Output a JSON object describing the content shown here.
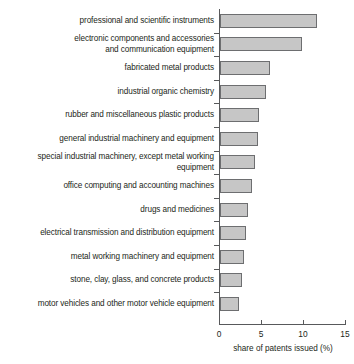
{
  "chart_data": {
    "type": "bar",
    "orientation": "horizontal",
    "title": "",
    "xlabel": "share of patents issued (%)",
    "ylabel": "",
    "xlim": [
      0,
      15
    ],
    "xticks": [
      0,
      5,
      10,
      15
    ],
    "xtick_labels": [
      "0",
      "5",
      "10",
      "15"
    ],
    "grid": false,
    "legend": null,
    "categories": [
      "professional and scientific instruments",
      "electronic components and accessories\nand communication equipment",
      "fabricated metal products",
      "industrial organic chemistry",
      "rubber and miscellaneous plastic products",
      "general industrial machinery and equipment",
      "special industrial machinery, except metal working equipment",
      "office computing and accounting machines",
      "drugs and medicines",
      "electrical transmission and distribution equipment",
      "metal working machinery and equipment",
      "stone, clay, glass, and concrete products",
      "motor vehicles and other motor vehicle equipment"
    ],
    "values": [
      11.5,
      9.8,
      5.9,
      5.5,
      4.6,
      4.5,
      4.2,
      3.8,
      3.3,
      3.1,
      2.8,
      2.6,
      2.3
    ],
    "colors": {
      "bar_fill": "#c6c6c6",
      "bar_border": "#6d6e70",
      "axis": "#58595b",
      "text": "#231f20",
      "background": "#ffffff"
    }
  }
}
